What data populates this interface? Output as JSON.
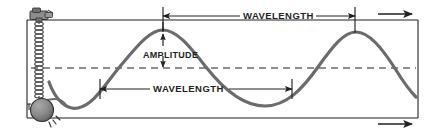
{
  "diagram": {
    "type": "physics-wave-diagram",
    "labels": {
      "amplitude": "AMPLITUDE",
      "wavelength_top": "WAVELENGTH",
      "wavelength_bottom": "WAVELENGTH"
    },
    "parts": {
      "clamp": "clamp",
      "spring": "spring",
      "bob": "bob",
      "equilibrium_line": "equilibrium-line",
      "wave_curve": "wave-curve",
      "direction_arrow_top": "wave-direction-arrow",
      "direction_arrow_bottom": "wave-direction-arrow"
    },
    "colors": {
      "ink": "#231f20",
      "wave": "#6b6b6b",
      "bob_fill": "#848484",
      "spring": "#5a5a5a",
      "background": "#ffffff"
    },
    "geometry": {
      "frame": {
        "left": 27,
        "top": 20,
        "right": 418,
        "bottom": 118
      },
      "equilibrium_y": 68,
      "amplitude_px": 40,
      "wavelength_px": 192,
      "crests_x": [
        163,
        355
      ],
      "troughs_x": [
        78,
        265
      ],
      "wavelength_top_span": [
        163,
        355
      ],
      "wavelength_bottom_span": [
        100,
        292
      ]
    }
  }
}
